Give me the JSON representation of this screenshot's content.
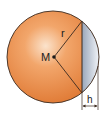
{
  "diagram": {
    "labels": {
      "center": "M",
      "radius": "r",
      "cap_height": "h"
    },
    "colors": {
      "sphere_fill": "#e98a45",
      "sphere_highlight": "#f7c9a2",
      "cap_fill": "#b9c3d1",
      "cap_highlight": "#eef1f6",
      "stroke": "#3a2a20"
    }
  }
}
